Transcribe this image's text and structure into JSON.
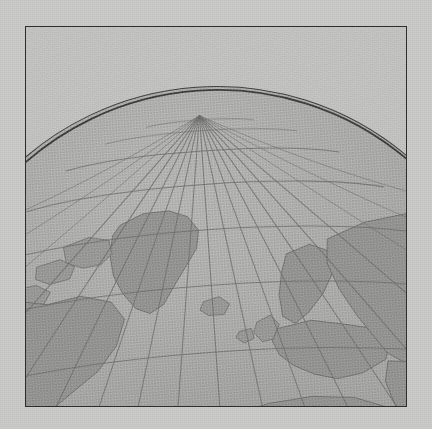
{
  "figure": {
    "kind": "globe-map",
    "title": "Orthographic globe, North Pole region",
    "caption": "",
    "projection": "orthographic",
    "center_view": "north polar, tilted toward Europe / Africa",
    "frame": {
      "border_color": "#2e2e2e",
      "border_width_px": 1.5,
      "x": 25,
      "y": 26,
      "width": 382,
      "height": 381
    },
    "colors": {
      "page_background": "#cbcbc9",
      "sky_background": "#c4c4c2",
      "ocean": "#afafad",
      "land": "#9a9a98",
      "graticule": "#6f6f6f",
      "limb_outline": "#3a3a3a"
    },
    "globe_geometry": {
      "apex_x": 218,
      "apex_y": 85,
      "limb_left_edge_y": 155,
      "limb_right_edge_y": 160,
      "pole_convergence_x": 218,
      "pole_convergence_y": 88
    },
    "graticule_spec": {
      "meridian_interval_deg": 10,
      "parallel_interval_deg": 10,
      "pole_shown": "North Pole",
      "grid_visible": true
    },
    "landmasses": [
      "Greenland",
      "Northern Canada",
      "Canadian Arctic Archipelago",
      "Iceland",
      "Scandinavia",
      "British Isles",
      "Europe",
      "Mediterranean Sea",
      "North Africa",
      "West Africa",
      "Arabian Peninsula",
      "Russia / Siberia",
      "Central Asia",
      "Atlantic Ocean"
    ],
    "render_style": "halftone print, grayscale"
  },
  "a11y": {
    "alt": "Grayscale halftone printed map of a globe in orthographic projection showing the North Pole at top with meridians converging, and the continents of Europe, Africa, northern North America including Greenland, and Asia, enclosed in a thin dark rectangular frame."
  }
}
